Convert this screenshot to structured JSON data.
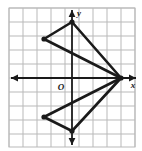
{
  "figure": {
    "kind": "coordinate-plane-polygon",
    "background_color": "#ffffff",
    "grid": {
      "visible": true,
      "line_color": "#b9b9b9",
      "border_color": "#b9b9b9",
      "cell_size_px": 14,
      "left_px": 9,
      "top_px": 8,
      "right_px": 135,
      "bottom_px": 147,
      "columns": 9,
      "rows": 10
    },
    "axes": {
      "color": "#1a1a1a",
      "origin_px": {
        "x": 72,
        "y": 78
      },
      "x_axis": {
        "label": "x",
        "label_px": {
          "x": 133,
          "y": 88
        },
        "start_px": {
          "x": 11,
          "y": 78
        },
        "end_px": {
          "x": 136,
          "y": 78
        },
        "arrow_start": true,
        "arrow_end": true
      },
      "y_axis": {
        "label": "y",
        "label_px": {
          "x": 79,
          "y": 16
        },
        "start_px": {
          "x": 72,
          "y": 10
        },
        "end_px": {
          "x": 72,
          "y": 145
        },
        "arrow_start": true,
        "arrow_end": true
      },
      "origin_label": {
        "text": "O",
        "label_px": {
          "x": 61,
          "y": 90
        }
      }
    },
    "shape": {
      "name": "bowtie-polygon",
      "stroke_color": "#1a1a1a",
      "stroke_width_px": 2.6,
      "fill": "none",
      "vertex_marker": "dot",
      "vertex_marker_radius_px": 2.6,
      "vertices_px": [
        {
          "name": "top-vertex",
          "x": 72,
          "y": 22
        },
        {
          "name": "upper-left-vertex",
          "x": 44,
          "y": 39
        },
        {
          "name": "right-vertex",
          "x": 121,
          "y": 78
        },
        {
          "name": "lower-left-vertex",
          "x": 44,
          "y": 117
        },
        {
          "name": "bottom-vertex",
          "x": 72,
          "y": 131
        }
      ],
      "vertices_units": [
        {
          "name": "top-vertex",
          "x": 0,
          "y": 4
        },
        {
          "name": "upper-left-vertex",
          "x": -2,
          "y": 2.8
        },
        {
          "name": "right-vertex",
          "x": 3.5,
          "y": 0
        },
        {
          "name": "lower-left-vertex",
          "x": -2,
          "y": -2.8
        },
        {
          "name": "bottom-vertex",
          "x": 0,
          "y": -3.8
        }
      ],
      "edges": [
        {
          "from": "top-vertex",
          "to": "upper-left-vertex"
        },
        {
          "from": "upper-left-vertex",
          "to": "right-vertex"
        },
        {
          "from": "right-vertex",
          "to": "top-vertex"
        },
        {
          "from": "right-vertex",
          "to": "lower-left-vertex"
        },
        {
          "from": "lower-left-vertex",
          "to": "bottom-vertex"
        },
        {
          "from": "bottom-vertex",
          "to": "right-vertex"
        }
      ]
    }
  }
}
